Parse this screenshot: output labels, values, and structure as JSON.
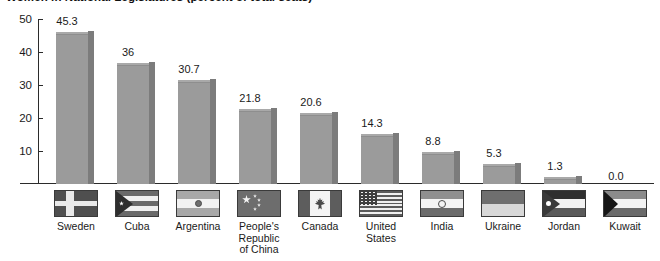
{
  "title": "Women in National Legislatures (percent of total seats)",
  "chart_data": {
    "type": "bar",
    "title": "Women in National Legislatures (percent of total seats)",
    "xlabel": "",
    "ylabel": "",
    "ylim": [
      0,
      50
    ],
    "yticks": [
      "10",
      "20",
      "30",
      "40",
      "50"
    ],
    "grid": false,
    "legend": "none",
    "value_labels": true,
    "categories": [
      "Sweden",
      "Cuba",
      "Argentina",
      "People's Republic of China",
      "Canada",
      "United States",
      "India",
      "Ukraine",
      "Jordan",
      "Kuwait"
    ],
    "values": [
      45.3,
      36,
      30.7,
      21.8,
      20.6,
      14.3,
      8.8,
      5.3,
      1.3,
      0.0
    ],
    "value_label_text": [
      "45.3",
      "36",
      "30.7",
      "21.8",
      "20.6",
      "14.3",
      "8.8",
      "5.3",
      "1.3",
      "0.0"
    ],
    "bar_color": "#9b9b9b",
    "bar_shade_color": "#7c7c7c",
    "axis_color": "#2b2b2b"
  },
  "axis": {
    "ticks": [
      {
        "label": "50",
        "value": 50
      },
      {
        "label": "40",
        "value": 40
      },
      {
        "label": "30",
        "value": 30
      },
      {
        "label": "20",
        "value": 20
      },
      {
        "label": "10",
        "value": 10
      }
    ]
  },
  "bars": [
    {
      "country": "Sweden",
      "value": 45.3,
      "label": "45.3",
      "flag": "flag-sweden",
      "lines": [
        "Sweden"
      ]
    },
    {
      "country": "Cuba",
      "value": 36,
      "label": "36",
      "flag": "flag-cuba",
      "lines": [
        "Cuba"
      ]
    },
    {
      "country": "Argentina",
      "value": 30.7,
      "label": "30.7",
      "flag": "flag-argentina",
      "lines": [
        "Argentina"
      ]
    },
    {
      "country": "People's Republic of China",
      "value": 21.8,
      "label": "21.8",
      "flag": "flag-china",
      "lines": [
        "People's",
        "Republic",
        "of China"
      ]
    },
    {
      "country": "Canada",
      "value": 20.6,
      "label": "20.6",
      "flag": "flag-canada",
      "lines": [
        "Canada"
      ]
    },
    {
      "country": "United States",
      "value": 14.3,
      "label": "14.3",
      "flag": "flag-united-states",
      "lines": [
        "United",
        "States"
      ]
    },
    {
      "country": "India",
      "value": 8.8,
      "label": "8.8",
      "flag": "flag-india",
      "lines": [
        "India"
      ]
    },
    {
      "country": "Ukraine",
      "value": 5.3,
      "label": "5.3",
      "flag": "flag-ukraine",
      "lines": [
        "Ukraine"
      ]
    },
    {
      "country": "Jordan",
      "value": 1.3,
      "label": "1.3",
      "flag": "flag-jordan",
      "lines": [
        "Jordan"
      ]
    },
    {
      "country": "Kuwait",
      "value": 0.0,
      "label": "0.0",
      "flag": "flag-kuwait",
      "lines": [
        "Kuwait"
      ]
    }
  ],
  "labels": {
    "l0": "Sweden",
    "l1": "Cuba",
    "l2": "Argentina",
    "l3a": "People's",
    "l3b": "Republic",
    "l3c": "of China",
    "l4": "Canada",
    "l5a": "United",
    "l5b": "States",
    "l6": "India",
    "l7": "Ukraine",
    "l8": "Jordan",
    "l9": "Kuwait"
  }
}
